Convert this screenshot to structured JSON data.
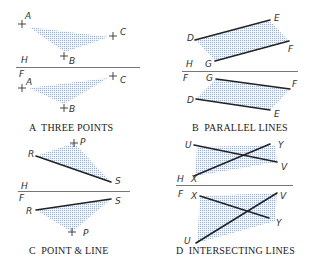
{
  "figure": {
    "panels": [
      {
        "id": "A",
        "caption": "A  THREE POINTS",
        "fold_labels": {
          "top": "H",
          "bottom": "F"
        },
        "top_view": {
          "points": [
            {
              "name": "A",
              "label": "A"
            },
            {
              "name": "B",
              "label": "B"
            },
            {
              "name": "C",
              "label": "C"
            }
          ]
        },
        "front_view": {
          "points": [
            {
              "name": "A",
              "label": "A"
            },
            {
              "name": "B",
              "label": "B"
            },
            {
              "name": "C",
              "label": "C"
            }
          ]
        }
      },
      {
        "id": "B",
        "caption": "B  PARALLEL LINES",
        "fold_labels": {
          "top": "H",
          "bottom": "F"
        },
        "top_view": {
          "labels": [
            "D",
            "E",
            "F",
            "G"
          ]
        },
        "front_view": {
          "labels": [
            "G",
            "F",
            "D",
            "E"
          ]
        }
      },
      {
        "id": "C",
        "caption": "C  POINT & LINE",
        "fold_labels": {
          "top": "H",
          "bottom": "F"
        },
        "top_view": {
          "labels": [
            "P",
            "R",
            "S"
          ]
        },
        "front_view": {
          "labels": [
            "S",
            "R",
            "P"
          ]
        }
      },
      {
        "id": "D",
        "caption": "D  INTERSECTING LINES",
        "fold_labels": {
          "top": "H",
          "bottom": "F"
        },
        "top_view": {
          "labels": [
            "U",
            "Y",
            "V",
            "X"
          ]
        },
        "front_view": {
          "labels": [
            "X",
            "V",
            "Y",
            "U"
          ]
        }
      }
    ],
    "colors": {
      "shading": "#9fb4d6",
      "line": "#222222",
      "fold_line": "#777777",
      "background": "#ffffff"
    }
  }
}
